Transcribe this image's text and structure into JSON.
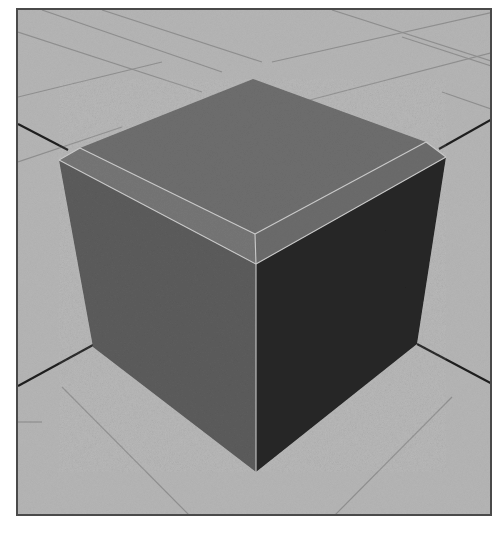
{
  "viewport": {
    "label": "3D perspective viewport",
    "background_color": "#b4b4b4",
    "border_color": "#4a4a4a"
  },
  "scene": {
    "object": "beveled-cube",
    "colors": {
      "floor": "#b6b6b6",
      "grid_line": "#8e8e8e",
      "axis_line": "#1e1e1e",
      "top_face": "#6e6e6e",
      "bevel_left": "#767676",
      "bevel_right": "#6c6c6c",
      "left_face": "#5c5c5c",
      "right_face": "#262626",
      "edge_highlight": "#c8c8c8"
    }
  }
}
